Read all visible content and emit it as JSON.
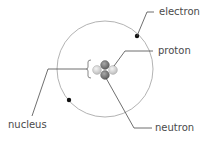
{
  "diagram": {
    "labels": {
      "electron": "electron",
      "proton": "proton",
      "nucleus": "nucleus",
      "neutron": "neutron"
    },
    "colors": {
      "orbit": "#9a9a9a",
      "leader_line": "#4a4a4a",
      "electron": "#111111",
      "proton": "#d8d8d8",
      "neutron": "#7a7a7a",
      "text": "#4a4a4a"
    },
    "counts": {
      "electrons": 2,
      "protons": 2,
      "neutrons": 2
    }
  }
}
